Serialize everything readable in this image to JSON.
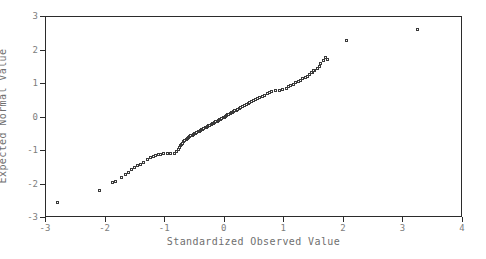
{
  "chart_data": {
    "type": "scatter",
    "title": "",
    "xlabel": "Standardized Observed Value",
    "ylabel": "Expected Normal Value",
    "xlim": [
      -3,
      4
    ],
    "ylim": [
      -3,
      3
    ],
    "xticks": [
      -3,
      -2,
      -1,
      0,
      1,
      2,
      3,
      4
    ],
    "yticks": [
      -3,
      -2,
      -1,
      0,
      1,
      2,
      3
    ],
    "xtick_labels": [
      "-3",
      "-2",
      "-1",
      "0",
      "1",
      "2",
      "3",
      "4"
    ],
    "ytick_labels": [
      "-3",
      "-2",
      "-1",
      "0",
      "1",
      "2",
      "3"
    ],
    "grid": false,
    "legend": null,
    "marker": "open-square",
    "marker_color": "#3a3a3a",
    "frame_color": "#2b2b2b",
    "tick_label_color": "#7d7d7d",
    "axis_label_color": "#6f6f6f",
    "background": "#ffffff",
    "series": [
      {
        "name": "Q-Q points",
        "points": [
          [
            -2.8,
            -2.55
          ],
          [
            -2.1,
            -2.2
          ],
          [
            -1.88,
            -1.97
          ],
          [
            -1.82,
            -1.93
          ],
          [
            -1.72,
            -1.8
          ],
          [
            -1.66,
            -1.72
          ],
          [
            -1.6,
            -1.66
          ],
          [
            -1.56,
            -1.58
          ],
          [
            -1.5,
            -1.52
          ],
          [
            -1.46,
            -1.46
          ],
          [
            -1.4,
            -1.42
          ],
          [
            -1.36,
            -1.36
          ],
          [
            -1.28,
            -1.26
          ],
          [
            -1.24,
            -1.22
          ],
          [
            -1.19,
            -1.18
          ],
          [
            -1.15,
            -1.15
          ],
          [
            -1.11,
            -1.11
          ],
          [
            -1.07,
            -1.12
          ],
          [
            -1.02,
            -1.1
          ],
          [
            -0.96,
            -1.1
          ],
          [
            -0.9,
            -1.1
          ],
          [
            -0.84,
            -1.09
          ],
          [
            -0.8,
            -1.02
          ],
          [
            -0.77,
            -0.96
          ],
          [
            -0.75,
            -0.9
          ],
          [
            -0.73,
            -0.86
          ],
          [
            -0.71,
            -0.82
          ],
          [
            -0.7,
            -0.78
          ],
          [
            -0.68,
            -0.74
          ],
          [
            -0.66,
            -0.7
          ],
          [
            -0.64,
            -0.67
          ],
          [
            -0.62,
            -0.64
          ],
          [
            -0.6,
            -0.61
          ],
          [
            -0.58,
            -0.58
          ],
          [
            -0.56,
            -0.56
          ],
          [
            -0.54,
            -0.54
          ],
          [
            -0.52,
            -0.52
          ],
          [
            -0.5,
            -0.5
          ],
          [
            -0.48,
            -0.48
          ],
          [
            -0.46,
            -0.46
          ],
          [
            -0.44,
            -0.44
          ],
          [
            -0.42,
            -0.42
          ],
          [
            -0.4,
            -0.4
          ],
          [
            -0.38,
            -0.38
          ],
          [
            -0.36,
            -0.36
          ],
          [
            -0.34,
            -0.34
          ],
          [
            -0.32,
            -0.32
          ],
          [
            -0.3,
            -0.3
          ],
          [
            -0.28,
            -0.28
          ],
          [
            -0.26,
            -0.26
          ],
          [
            -0.24,
            -0.24
          ],
          [
            -0.22,
            -0.22
          ],
          [
            -0.2,
            -0.2
          ],
          [
            -0.18,
            -0.18
          ],
          [
            -0.16,
            -0.16
          ],
          [
            -0.14,
            -0.14
          ],
          [
            -0.12,
            -0.12
          ],
          [
            -0.1,
            -0.1
          ],
          [
            -0.08,
            -0.08
          ],
          [
            -0.06,
            -0.06
          ],
          [
            -0.04,
            -0.04
          ],
          [
            -0.02,
            -0.02
          ],
          [
            0.0,
            0.0
          ],
          [
            0.02,
            0.02
          ],
          [
            0.04,
            0.04
          ],
          [
            0.06,
            0.06
          ],
          [
            0.08,
            0.08
          ],
          [
            0.1,
            0.1
          ],
          [
            0.12,
            0.12
          ],
          [
            0.14,
            0.14
          ],
          [
            0.16,
            0.16
          ],
          [
            0.18,
            0.18
          ],
          [
            0.2,
            0.2
          ],
          [
            0.22,
            0.22
          ],
          [
            0.25,
            0.25
          ],
          [
            0.28,
            0.28
          ],
          [
            0.31,
            0.31
          ],
          [
            0.34,
            0.34
          ],
          [
            0.37,
            0.37
          ],
          [
            0.4,
            0.4
          ],
          [
            0.43,
            0.43
          ],
          [
            0.46,
            0.46
          ],
          [
            0.49,
            0.49
          ],
          [
            0.52,
            0.52
          ],
          [
            0.56,
            0.55
          ],
          [
            0.6,
            0.58
          ],
          [
            0.64,
            0.62
          ],
          [
            0.68,
            0.65
          ],
          [
            0.72,
            0.69
          ],
          [
            0.76,
            0.72
          ],
          [
            0.8,
            0.76
          ],
          [
            0.86,
            0.78
          ],
          [
            0.92,
            0.8
          ],
          [
            0.98,
            0.82
          ],
          [
            1.04,
            0.86
          ],
          [
            1.08,
            0.9
          ],
          [
            1.12,
            0.94
          ],
          [
            1.16,
            0.98
          ],
          [
            1.2,
            1.02
          ],
          [
            1.24,
            1.06
          ],
          [
            1.28,
            1.1
          ],
          [
            1.32,
            1.14
          ],
          [
            1.36,
            1.18
          ],
          [
            1.4,
            1.22
          ],
          [
            1.44,
            1.28
          ],
          [
            1.48,
            1.34
          ],
          [
            1.52,
            1.4
          ],
          [
            1.56,
            1.46
          ],
          [
            1.6,
            1.52
          ],
          [
            1.62,
            1.6
          ],
          [
            1.66,
            1.7
          ],
          [
            1.7,
            1.78
          ],
          [
            1.74,
            1.72
          ],
          [
            1.5,
            1.4
          ],
          [
            1.46,
            1.32
          ],
          [
            2.05,
            2.28
          ],
          [
            3.25,
            2.62
          ]
        ]
      }
    ]
  },
  "axes": {
    "xlabel": "Standardized Observed Value",
    "ylabel": "Expected Normal Value"
  }
}
